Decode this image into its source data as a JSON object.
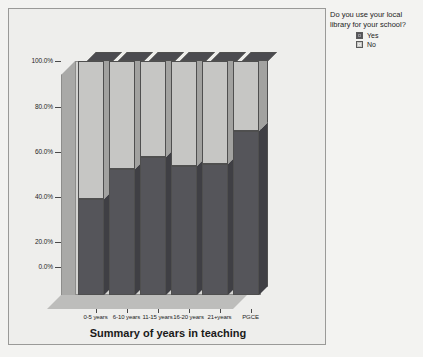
{
  "chart_data": {
    "type": "bar",
    "subtype": "stacked-percentage-3d",
    "title": "",
    "xlabel": "Summary of years in teaching",
    "ylabel": "",
    "categories": [
      "0-5 years",
      "6-10 years",
      "11-15 years",
      "16-20 years",
      "21+years",
      "PGCE"
    ],
    "ytick_labels": [
      "100.0%",
      "80.0%",
      "60.0%",
      "40.0%",
      "20.0%",
      "0.0%"
    ],
    "ytick_values": [
      100,
      80,
      60,
      40,
      20,
      0
    ],
    "ylim": [
      0,
      100
    ],
    "grid": false,
    "legend_position": "right",
    "series": [
      {
        "name": "Yes",
        "color": "#55555a",
        "values": [
          41,
          54,
          59,
          55,
          56,
          70
        ]
      },
      {
        "name": "No",
        "color": "#c6c6c4",
        "values": [
          59,
          46,
          41,
          45,
          44,
          30
        ]
      }
    ]
  },
  "legend": {
    "title_line1": "Do you use your local",
    "title_line2": "library for your school?",
    "items": [
      {
        "label": "Yes",
        "color": "#55555a"
      },
      {
        "label": "No",
        "color": "#c6c6c4"
      }
    ]
  },
  "axis": {
    "x_title": "Summary of years in teaching"
  }
}
